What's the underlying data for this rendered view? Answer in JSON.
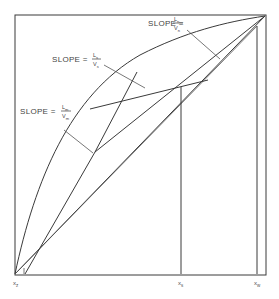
{
  "diagram": {
    "type": "mccabe-thiele-style operating line diagram",
    "slope_labels": [
      {
        "id": "n",
        "prefix": "SLOPE =",
        "numerator": "L",
        "numerator_sub": "n",
        "denominator": "V",
        "denominator_sub": "n"
      },
      {
        "id": "s",
        "prefix": "SLOPE =",
        "numerator": "L",
        "numerator_sub": "s",
        "denominator": "V",
        "denominator_sub": "s"
      },
      {
        "id": "m",
        "prefix": "SLOPE =",
        "numerator": "L",
        "numerator_sub": "m",
        "denominator": "V",
        "denominator_sub": "m"
      }
    ],
    "x_axis_labels": [
      {
        "id": "xz",
        "symbol": "x",
        "sub": "z"
      },
      {
        "id": "xs",
        "symbol": "x",
        "sub": "s"
      },
      {
        "id": "xw",
        "symbol": "x",
        "sub": "w"
      }
    ],
    "colors": {
      "line": "#3a3a3a",
      "text": "#444444",
      "background": "#ffffff"
    }
  }
}
